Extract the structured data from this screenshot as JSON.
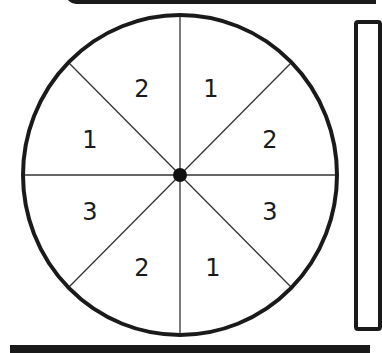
{
  "spinner": {
    "sector_count": 8,
    "center": {
      "x": 180,
      "y": 175
    },
    "radius": 159,
    "outline_color": "#1a1a1a",
    "divider_color": "#333333",
    "hub_color": "#111111",
    "sectors": [
      {
        "position": "top-right",
        "label": "1"
      },
      {
        "position": "right-upper",
        "label": "2"
      },
      {
        "position": "right-lower",
        "label": "3"
      },
      {
        "position": "bottom-right",
        "label": "1"
      },
      {
        "position": "bottom-left",
        "label": "2"
      },
      {
        "position": "left-lower",
        "label": "3"
      },
      {
        "position": "left-upper",
        "label": "1"
      },
      {
        "position": "top-left",
        "label": "2"
      }
    ]
  }
}
